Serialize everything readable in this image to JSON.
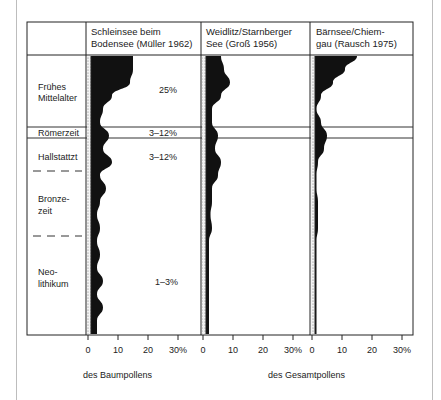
{
  "chart_data": {
    "type": "area",
    "title": "",
    "periods": [
      {
        "label": "Frühes Mittelalter",
        "lines": [
          "Frühes",
          "Mittelalter"
        ]
      },
      {
        "label": "Römerzeit",
        "lines": [
          "Römerzeit"
        ]
      },
      {
        "label": "Hallstattzt",
        "lines": [
          "Hallstattzt"
        ]
      },
      {
        "label": "Bronzezeit",
        "lines": [
          "Bronze-",
          "zeit"
        ]
      },
      {
        "label": "Neolithikum",
        "lines": [
          "Neo-",
          "lithikum"
        ]
      }
    ],
    "series": [
      {
        "name": "Schleinsee beim Bodensee (Müller 1962)",
        "header_lines": [
          "Schleinsee beim",
          "Bodensee (Müller 1962)"
        ],
        "basis": "des Baumpollens",
        "annotations": [
          {
            "period": "Frühes Mittelalter",
            "text": "25%"
          },
          {
            "period": "Römerzeit",
            "text": "3–12%"
          },
          {
            "period": "Hallstattzt",
            "text": "3–12%"
          },
          {
            "period": "Neolithikum",
            "text": "1–3%"
          }
        ],
        "profile_pct_top_to_bottom": [
          14,
          14,
          13,
          7,
          4,
          3,
          6,
          4,
          7,
          3,
          5,
          3,
          2,
          3,
          2,
          3,
          2,
          4,
          2,
          4,
          2,
          2
        ]
      },
      {
        "name": "Weidlitz/Starnberger See (Groß 1956)",
        "header_lines": [
          "Weidlitz/Starnberger",
          "See (Groß 1956)"
        ],
        "basis": "des Gesamtpollens",
        "annotations": [],
        "profile_pct_top_to_bottom": [
          5,
          6,
          8,
          5,
          2,
          2,
          4,
          3,
          5,
          4,
          2,
          2,
          1.5,
          2,
          1,
          1,
          1,
          1,
          1,
          1,
          1,
          1
        ]
      },
      {
        "name": "Bärnsee/Chiemgau (Rausch 1975)",
        "header_lines": [
          "Bärnsee/Chiem-",
          "gau (Rausch 1975)"
        ],
        "basis": "des Gesamtpollens",
        "annotations": [],
        "profile_pct_top_to_bottom": [
          14,
          10,
          6,
          2,
          0.5,
          2,
          4,
          3,
          1,
          0.5,
          0.5,
          1,
          1,
          1,
          0.5,
          0.5,
          0.5,
          0.5,
          0.5,
          0.5,
          0.5,
          0.5
        ]
      }
    ],
    "x_ticks": [
      "0",
      "10",
      "20",
      "30%"
    ],
    "xlim": [
      0,
      30
    ],
    "xlabels": [
      "des Baumpollens",
      "des Gesamtpollens"
    ],
    "grid": false
  }
}
